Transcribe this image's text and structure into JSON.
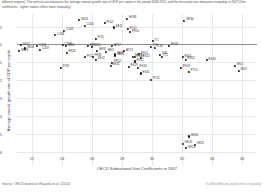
{
  "caption": "different regions). The vertical axis measures the average annual growth rate of GDP per capita in the period 2008-2012; and the horizontal axis measures inequality in 2007 (Gini coefficients - higher values reflect more inequality).",
  "source": "Source: OECD based on Royuela et al. (2014)",
  "watermark": "OurWorldInData.org/income-inequality",
  "chart_data": {
    "type": "scatter",
    "title": "",
    "xlabel": "OECD Subnational Gini Coefficients in 2007",
    "ylabel": "Average annual growth rate of GDP per capita",
    "xlim": [
      21.0,
      37.0
    ],
    "ylim": [
      -6.8,
      1.7
    ],
    "xticks": [
      22,
      24,
      26,
      28,
      30,
      32,
      34,
      36
    ],
    "yticks": [
      1,
      0,
      -1,
      -2,
      -3,
      -4,
      -5,
      -6
    ],
    "grid": true,
    "zero_reference_line": 0,
    "legend": "none",
    "points": [
      {
        "label": "SK02",
        "x": 21.25,
        "y": -0.05
      },
      {
        "label": "SK04",
        "x": 21.55,
        "y": -0.22
      },
      {
        "label": "CZ05",
        "x": 22.35,
        "y": -0.1
      },
      {
        "label": "CZ07",
        "x": 22.55,
        "y": -0.3
      },
      {
        "label": "CZ06",
        "x": 23.55,
        "y": 0.52
      },
      {
        "label": "CZ03",
        "x": 24.15,
        "y": 0.75
      },
      {
        "label": "CZ08",
        "x": 24.05,
        "y": -0.05
      },
      {
        "label": "CZ02",
        "x": 24.25,
        "y": -0.1
      },
      {
        "label": "FR26",
        "x": 24.3,
        "y": -0.48
      },
      {
        "label": "FI18",
        "x": 23.95,
        "y": -1.3
      },
      {
        "label": "CZ04",
        "x": 25.5,
        "y": 1.05
      },
      {
        "label": "BE2",
        "x": 25.75,
        "y": -0.1
      },
      {
        "label": "CZ01",
        "x": 26.0,
        "y": -0.12
      },
      {
        "label": "FI13",
        "x": 26.25,
        "y": 0.3
      },
      {
        "label": "SE31",
        "x": 26.35,
        "y": -0.35
      },
      {
        "label": "BE3",
        "x": 26.95,
        "y": -0.42
      },
      {
        "label": "FI12",
        "x": 25.55,
        "y": -0.72
      },
      {
        "label": "SE12",
        "x": 26.25,
        "y": -0.85
      },
      {
        "label": "AT12",
        "x": 27.35,
        "y": -0.1
      },
      {
        "label": "FR82",
        "x": 26.05,
        "y": -0.68
      },
      {
        "label": "SE11",
        "x": 27.45,
        "y": 0.95
      },
      {
        "label": "SE21",
        "x": 27.55,
        "y": -0.55
      },
      {
        "label": "SE22",
        "x": 27.55,
        "y": -0.62
      },
      {
        "label": "FR52",
        "x": 27.35,
        "y": -1.02
      },
      {
        "label": "SE32",
        "x": 27.25,
        "y": -1.18
      },
      {
        "label": "FR10",
        "x": 28.55,
        "y": 0.68
      },
      {
        "label": "ES21",
        "x": 28.75,
        "y": -0.68
      },
      {
        "label": "ES11",
        "x": 29.15,
        "y": -0.55
      },
      {
        "label": "ES13",
        "x": 28.85,
        "y": -0.72
      },
      {
        "label": "ES22",
        "x": 29.25,
        "y": -0.75
      },
      {
        "label": "ES12",
        "x": 28.85,
        "y": -0.95
      },
      {
        "label": "ES23",
        "x": 28.45,
        "y": -1.25
      },
      {
        "label": "ES24",
        "x": 29.05,
        "y": -1.3
      },
      {
        "label": "ES41",
        "x": 29.25,
        "y": -1.62
      },
      {
        "label": "IT1",
        "x": 30.05,
        "y": 0.18
      },
      {
        "label": "IT4",
        "x": 29.95,
        "y": -0.12
      },
      {
        "label": "IT34",
        "x": 30.2,
        "y": -0.18
      },
      {
        "label": "IT5",
        "x": 30.65,
        "y": -0.7
      },
      {
        "label": "PT11",
        "x": 29.95,
        "y": -1.98
      },
      {
        "label": "ES30",
        "x": 31.15,
        "y": -0.08
      },
      {
        "label": "ES51",
        "x": 32.05,
        "y": -0.72
      },
      {
        "label": "ES52",
        "x": 32.25,
        "y": -0.85
      },
      {
        "label": "ES53",
        "x": 31.95,
        "y": -1.32
      },
      {
        "label": "PT15",
        "x": 32.45,
        "y": -1.52
      },
      {
        "label": "ES43",
        "x": 33.65,
        "y": -0.88
      },
      {
        "label": "IE01",
        "x": 35.55,
        "y": -1.18
      },
      {
        "label": "IE02",
        "x": 35.8,
        "y": -1.48
      },
      {
        "label": "SK01",
        "x": 25.15,
        "y": 1.35
      },
      {
        "label": "PL62",
        "x": 26.85,
        "y": 1.18
      },
      {
        "label": "HU33",
        "x": 28.35,
        "y": 1.42
      },
      {
        "label": "PL51",
        "x": 28.4,
        "y": 0.85
      },
      {
        "label": "GR30",
        "x": 32.15,
        "y": 1.32
      },
      {
        "label": "GR41",
        "x": 32.45,
        "y": -5.15
      },
      {
        "label": "GR24",
        "x": 32.05,
        "y": -5.55
      },
      {
        "label": "GR14",
        "x": 32.25,
        "y": -5.8
      },
      {
        "label": "GR21",
        "x": 32.85,
        "y": -5.62
      },
      {
        "label": "SK03",
        "x": 21.15,
        "y": -0.38
      },
      {
        "label": "AT13",
        "x": 28.15,
        "y": -0.38
      },
      {
        "label": "UKL",
        "x": 30.55,
        "y": -0.58
      }
    ]
  }
}
